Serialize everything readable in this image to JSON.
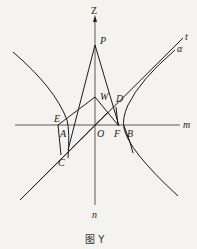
{
  "figure": {
    "caption": "图 Y",
    "axes": {
      "vertical_top": "Z",
      "vertical_bottom": "n",
      "horizontal_right": "m"
    },
    "points": {
      "P": "P",
      "W": "W",
      "D": "D",
      "E": "E",
      "A": "A",
      "O": "O",
      "F": "F",
      "B": "B",
      "C": "C"
    },
    "lines": {
      "t": "t",
      "alpha": "α"
    },
    "colors": {
      "stroke": "#1a1a1a",
      "background": "#f4f3ef"
    }
  }
}
